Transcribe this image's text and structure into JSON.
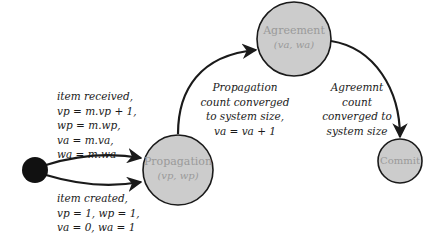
{
  "diagram": {
    "type": "state-machine",
    "colors": {
      "node_fill": "#cccccc",
      "node_stroke": "#1a1a1a",
      "node_text": "#9a9a9a",
      "initial_fill": "#111111",
      "edge": "#1a1a1a",
      "label_text": "#1a1a1a"
    },
    "nodes": {
      "initial": {
        "label": ""
      },
      "propagation": {
        "label": "Propagation",
        "sub": "(vp, wp)"
      },
      "agreement": {
        "label": "Agreement",
        "sub": "(va, wa)"
      },
      "commit": {
        "label": "Commit"
      }
    },
    "edges": {
      "item_received": {
        "from": "initial",
        "to": "propagation",
        "lines": [
          "item received,",
          "vp = m.vp + 1,",
          "wp = m.wp,",
          "va = m.va,",
          "wa = m.wa"
        ]
      },
      "item_created": {
        "from": "initial",
        "to": "propagation",
        "lines": [
          "item created,",
          "vp = 1, wp = 1,",
          "va = 0, wa = 1"
        ]
      },
      "propagation_converged": {
        "from": "propagation",
        "to": "agreement",
        "lines": [
          "Propagation",
          "count converged",
          "to system size,",
          "va = va + 1"
        ]
      },
      "agreement_converged": {
        "from": "agreement",
        "to": "commit",
        "lines": [
          "Agreemnt",
          "count",
          "converged to",
          "system size"
        ]
      }
    }
  }
}
